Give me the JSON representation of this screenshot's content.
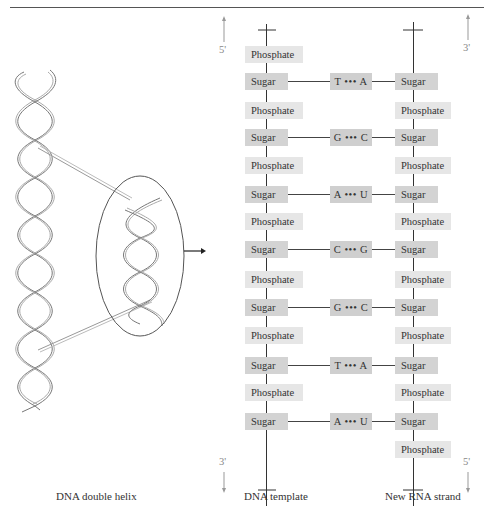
{
  "figure": {
    "captions": {
      "helix": "DNA double helix",
      "template": "DNA template",
      "rna": "New RNA strand"
    },
    "end_labels": {
      "template_top": "5'",
      "template_bottom": "3'",
      "rna_top": "3'",
      "rna_bottom": "5'"
    },
    "template_strand": [
      {
        "type": "Phosphate"
      },
      {
        "type": "Sugar"
      },
      {
        "type": "Phosphate"
      },
      {
        "type": "Sugar"
      },
      {
        "type": "Phosphate"
      },
      {
        "type": "Sugar"
      },
      {
        "type": "Phosphate"
      },
      {
        "type": "Sugar"
      },
      {
        "type": "Phosphate"
      },
      {
        "type": "Sugar"
      },
      {
        "type": "Phosphate"
      },
      {
        "type": "Sugar"
      },
      {
        "type": "Phosphate"
      },
      {
        "type": "Sugar"
      }
    ],
    "rna_strand": [
      {
        "type": "Sugar"
      },
      {
        "type": "Phosphate"
      },
      {
        "type": "Sugar"
      },
      {
        "type": "Phosphate"
      },
      {
        "type": "Sugar"
      },
      {
        "type": "Phosphate"
      },
      {
        "type": "Sugar"
      },
      {
        "type": "Phosphate"
      },
      {
        "type": "Sugar"
      },
      {
        "type": "Phosphate"
      },
      {
        "type": "Sugar"
      },
      {
        "type": "Phosphate"
      },
      {
        "type": "Sugar"
      },
      {
        "type": "Phosphate"
      }
    ],
    "base_pairs": [
      {
        "label": "T ••• A",
        "template": "T",
        "rna": "A"
      },
      {
        "label": "G ••• C",
        "template": "G",
        "rna": "C"
      },
      {
        "label": "A ••• U",
        "template": "A",
        "rna": "U"
      },
      {
        "label": "C ••• G",
        "template": "C",
        "rna": "G"
      },
      {
        "label": "G ••• C",
        "template": "G",
        "rna": "C"
      },
      {
        "label": "T ••• A",
        "template": "T",
        "rna": "A"
      },
      {
        "label": "A ••• U",
        "template": "A",
        "rna": "U"
      }
    ]
  }
}
